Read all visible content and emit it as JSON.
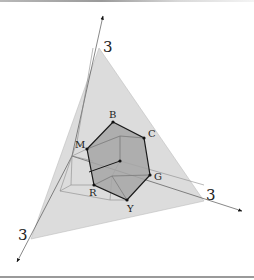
{
  "figure": {
    "axis_labels": {
      "top": "3",
      "right": "3",
      "left": "3"
    },
    "vertex_labels": {
      "B": "B",
      "C": "C",
      "G": "G",
      "Y": "Y",
      "R": "R",
      "M": "M"
    },
    "colors": {
      "triangle_fill": "#d9d9d9",
      "hexagon_fill": "#a9a9a9",
      "edges": "#1a1a1a",
      "axes": "#333333",
      "hidden_lines": "#8c8c8c"
    }
  }
}
